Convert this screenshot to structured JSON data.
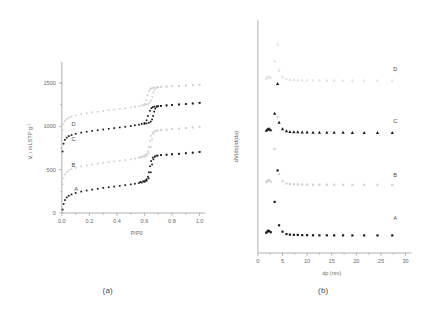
{
  "figure": {
    "panels": [
      {
        "id": "panel-a",
        "caption": "(a)",
        "xlabel": "P/P0",
        "ylabel": "V, / mLSTP g",
        "ylabel_sup": "-1",
        "xticks": [
          "0.0",
          "0.2",
          "0.4",
          "0.6",
          "0.8",
          "1.0"
        ],
        "yticks": [
          "0",
          "500",
          "1000",
          "1500"
        ],
        "series_labels": [
          "A",
          "B",
          "C",
          "D"
        ]
      },
      {
        "id": "panel-b",
        "caption": "(b)",
        "xlabel": "dp (nm)",
        "ylabel": "dV(dp)/d(dp)",
        "xticks": [
          "0",
          "5",
          "10",
          "15",
          "20",
          "25",
          "30"
        ],
        "series_labels": [
          "A",
          "B",
          "C",
          "D"
        ]
      }
    ]
  },
  "chart_data": [
    {
      "type": "scatter",
      "id": "panel-a",
      "title": "",
      "subtitle": "(a)",
      "xlabel": "P/P0",
      "ylabel": "V, / mLSTP g-1",
      "xlim": [
        0.0,
        1.0
      ],
      "ylim": [
        0,
        1650
      ],
      "xticks": [
        0.0,
        0.2,
        0.4,
        0.6,
        0.8,
        1.0
      ],
      "yticks": [
        0,
        500,
        1000,
        1500
      ],
      "grid": false,
      "legend_position": "inline-labels",
      "annotations": [
        {
          "text": "A",
          "x": 0.09,
          "y": 250
        },
        {
          "text": "B",
          "x": 0.07,
          "y": 530
        },
        {
          "text": "C",
          "x": 0.07,
          "y": 835
        },
        {
          "text": "D",
          "x": 0.07,
          "y": 1000
        }
      ],
      "series": [
        {
          "name": "A",
          "marker": "square",
          "color": "#1a1a1a",
          "branch": "adsorption",
          "x": [
            0.005,
            0.012,
            0.022,
            0.035,
            0.05,
            0.07,
            0.1,
            0.14,
            0.18,
            0.22,
            0.26,
            0.3,
            0.34,
            0.38,
            0.42,
            0.46,
            0.5,
            0.53,
            0.56,
            0.58,
            0.6,
            0.615,
            0.63,
            0.645,
            0.655,
            0.665,
            0.675,
            0.69,
            0.72,
            0.76,
            0.8,
            0.85,
            0.9,
            0.95,
            1.0
          ],
          "y": [
            40,
            105,
            150,
            180,
            200,
            215,
            232,
            248,
            260,
            270,
            280,
            290,
            298,
            306,
            314,
            322,
            330,
            338,
            346,
            352,
            360,
            372,
            400,
            470,
            560,
            620,
            650,
            662,
            668,
            673,
            678,
            684,
            690,
            697,
            705
          ]
        },
        {
          "name": "A-desorption",
          "marker": "square",
          "color": "#1a1a1a",
          "branch": "desorption",
          "x": [
            1.0,
            0.95,
            0.9,
            0.85,
            0.8,
            0.76,
            0.72,
            0.695,
            0.675,
            0.66,
            0.648,
            0.64,
            0.632,
            0.625,
            0.615,
            0.605,
            0.59,
            0.57
          ],
          "y": [
            705,
            697,
            690,
            684,
            678,
            673,
            668,
            663,
            655,
            640,
            600,
            540,
            470,
            420,
            390,
            375,
            366,
            358
          ]
        },
        {
          "name": "B",
          "marker": "square",
          "color": "#cdcdcd",
          "branch": "adsorption",
          "x": [
            0.005,
            0.012,
            0.022,
            0.035,
            0.05,
            0.07,
            0.1,
            0.14,
            0.18,
            0.22,
            0.26,
            0.3,
            0.34,
            0.38,
            0.42,
            0.46,
            0.5,
            0.53,
            0.56,
            0.58,
            0.6,
            0.615,
            0.63,
            0.645,
            0.655,
            0.665,
            0.675,
            0.69,
            0.72,
            0.76,
            0.8,
            0.85,
            0.9,
            0.95,
            1.0
          ],
          "y": [
            330,
            400,
            445,
            472,
            492,
            506,
            522,
            538,
            550,
            560,
            570,
            580,
            588,
            596,
            604,
            612,
            620,
            628,
            636,
            642,
            650,
            662,
            690,
            760,
            850,
            910,
            940,
            952,
            958,
            963,
            968,
            974,
            980,
            987,
            995
          ]
        },
        {
          "name": "B-desorption",
          "marker": "square",
          "color": "#cdcdcd",
          "branch": "desorption",
          "x": [
            1.0,
            0.95,
            0.9,
            0.85,
            0.8,
            0.76,
            0.72,
            0.695,
            0.675,
            0.66,
            0.648,
            0.64,
            0.632,
            0.625,
            0.615,
            0.605,
            0.59,
            0.57
          ],
          "y": [
            995,
            987,
            980,
            974,
            968,
            963,
            958,
            953,
            945,
            930,
            890,
            830,
            760,
            710,
            680,
            665,
            656,
            648
          ]
        },
        {
          "name": "C",
          "marker": "square",
          "color": "#1a1a1a",
          "branch": "adsorption",
          "x": [
            0.005,
            0.012,
            0.022,
            0.035,
            0.05,
            0.07,
            0.1,
            0.14,
            0.18,
            0.22,
            0.26,
            0.3,
            0.34,
            0.38,
            0.42,
            0.46,
            0.5,
            0.53,
            0.56,
            0.58,
            0.6,
            0.615,
            0.625,
            0.64,
            0.65,
            0.66,
            0.672,
            0.69,
            0.72,
            0.76,
            0.8,
            0.85,
            0.9,
            0.95,
            1.0
          ],
          "y": [
            710,
            800,
            845,
            870,
            888,
            900,
            914,
            928,
            938,
            948,
            956,
            964,
            972,
            980,
            988,
            996,
            1004,
            1012,
            1020,
            1028,
            1040,
            1070,
            1120,
            1180,
            1210,
            1222,
            1228,
            1232,
            1237,
            1242,
            1247,
            1253,
            1258,
            1264,
            1272
          ]
        },
        {
          "name": "C-desorption",
          "marker": "square",
          "color": "#1a1a1a",
          "branch": "desorption",
          "x": [
            1.0,
            0.95,
            0.9,
            0.85,
            0.8,
            0.76,
            0.72,
            0.7,
            0.688,
            0.678,
            0.67,
            0.662,
            0.655,
            0.645,
            0.632,
            0.615,
            0.6
          ],
          "y": [
            1272,
            1264,
            1258,
            1253,
            1247,
            1242,
            1237,
            1233,
            1225,
            1205,
            1170,
            1120,
            1080,
            1055,
            1042,
            1034,
            1028
          ]
        },
        {
          "name": "D",
          "marker": "square",
          "color": "#cdcdcd",
          "branch": "adsorption",
          "x": [
            0.005,
            0.012,
            0.022,
            0.035,
            0.05,
            0.07,
            0.1,
            0.14,
            0.18,
            0.22,
            0.26,
            0.3,
            0.34,
            0.38,
            0.42,
            0.46,
            0.5,
            0.53,
            0.56,
            0.58,
            0.6,
            0.612,
            0.622,
            0.634,
            0.645,
            0.655,
            0.668,
            0.69,
            0.72,
            0.76,
            0.8,
            0.85,
            0.9,
            0.95,
            1.0
          ],
          "y": [
            960,
            1025,
            1062,
            1086,
            1102,
            1114,
            1128,
            1142,
            1152,
            1162,
            1170,
            1178,
            1186,
            1194,
            1202,
            1210,
            1218,
            1226,
            1236,
            1244,
            1258,
            1300,
            1360,
            1412,
            1434,
            1442,
            1448,
            1452,
            1456,
            1460,
            1464,
            1468,
            1472,
            1477,
            1482
          ]
        },
        {
          "name": "D-desorption",
          "marker": "square",
          "color": "#cdcdcd",
          "branch": "desorption",
          "x": [
            1.0,
            0.95,
            0.9,
            0.85,
            0.8,
            0.76,
            0.72,
            0.7,
            0.686,
            0.674,
            0.665,
            0.656,
            0.648,
            0.638,
            0.625,
            0.61,
            0.595
          ],
          "y": [
            1482,
            1477,
            1472,
            1468,
            1464,
            1460,
            1456,
            1452,
            1444,
            1424,
            1390,
            1340,
            1300,
            1275,
            1260,
            1252,
            1246
          ]
        }
      ]
    },
    {
      "type": "scatter",
      "id": "panel-b",
      "title": "",
      "subtitle": "(b)",
      "xlabel": "dp (nm)",
      "ylabel": "dV(dp)/d(dp)",
      "xlim": [
        0,
        30
      ],
      "ylim": [
        0,
        4
      ],
      "xticks": [
        0,
        5,
        10,
        15,
        20,
        25,
        30
      ],
      "yticks": [],
      "grid": false,
      "legend_position": "right-inline",
      "annotations": [
        {
          "text": "A",
          "x": 27.5,
          "y": 0.62
        },
        {
          "text": "B",
          "x": 27.5,
          "y": 1.42
        },
        {
          "text": "C",
          "x": 27.5,
          "y": 2.45
        },
        {
          "text": "D",
          "x": 27.5,
          "y": 3.42
        }
      ],
      "series": [
        {
          "name": "A",
          "marker": "square",
          "color": "#1a1a1a",
          "baseline": 0.33,
          "x": [
            1.7,
            1.9,
            2.1,
            2.3,
            2.6,
            3.4,
            4.0,
            4.3,
            5.0,
            5.8,
            6.5,
            7.3,
            8.1,
            9.0,
            10.0,
            11.2,
            12.5,
            14.0,
            15.5,
            17.3,
            19.2,
            21.6,
            24.3,
            27.3
          ],
          "y": [
            0.38,
            0.4,
            0.42,
            0.41,
            0.39,
            0.96,
            1.55,
            0.52,
            0.4,
            0.355,
            0.345,
            0.34,
            0.34,
            0.335,
            0.335,
            0.333,
            0.332,
            0.332,
            0.331,
            0.331,
            0.33,
            0.33,
            0.33,
            0.33
          ]
        },
        {
          "name": "B",
          "marker": "square",
          "color": "#d2d2d2",
          "baseline": 1.28,
          "x": [
            1.7,
            1.9,
            2.1,
            2.3,
            2.6,
            3.4,
            4.0,
            4.3,
            5.0,
            5.8,
            6.5,
            7.3,
            8.1,
            9.0,
            10.0,
            11.2,
            12.5,
            14.0,
            15.5,
            17.3,
            19.2,
            21.6,
            24.3,
            27.3
          ],
          "y": [
            1.33,
            1.35,
            1.37,
            1.36,
            1.34,
            1.95,
            2.55,
            1.48,
            1.35,
            1.305,
            1.295,
            1.29,
            1.29,
            1.285,
            1.285,
            1.283,
            1.282,
            1.282,
            1.281,
            1.281,
            1.28,
            1.28,
            1.28,
            1.28
          ]
        },
        {
          "name": "C",
          "marker": "triangle",
          "color": "#1a1a1a",
          "baseline": 2.26,
          "x": [
            1.7,
            1.9,
            2.1,
            2.3,
            2.6,
            3.4,
            4.0,
            4.3,
            5.0,
            5.8,
            6.5,
            7.3,
            8.1,
            9.0,
            10.0,
            11.2,
            12.5,
            14.0,
            15.5,
            17.3,
            19.2,
            21.6,
            24.3,
            27.3
          ],
          "y": [
            2.3,
            2.32,
            2.33,
            2.33,
            2.31,
            2.62,
            3.18,
            2.45,
            2.33,
            2.29,
            2.28,
            2.275,
            2.272,
            2.27,
            2.268,
            2.266,
            2.265,
            2.264,
            2.263,
            2.262,
            2.261,
            2.26,
            2.26,
            2.26
          ]
        },
        {
          "name": "D",
          "marker": "triangle",
          "color": "#e2e2e2",
          "baseline": 3.24,
          "x": [
            1.7,
            1.9,
            2.1,
            2.3,
            2.6,
            3.4,
            4.0,
            4.3,
            5.0,
            5.8,
            6.5,
            7.3,
            8.1,
            9.0,
            10.0,
            11.2,
            12.5,
            14.0,
            15.5,
            17.3,
            19.2,
            21.6,
            24.3,
            27.3
          ],
          "y": [
            3.28,
            3.3,
            3.31,
            3.31,
            3.29,
            3.6,
            3.92,
            3.43,
            3.31,
            3.27,
            3.26,
            3.255,
            3.252,
            3.25,
            3.248,
            3.246,
            3.245,
            3.244,
            3.243,
            3.242,
            3.241,
            3.24,
            3.24,
            3.24
          ]
        }
      ]
    }
  ]
}
